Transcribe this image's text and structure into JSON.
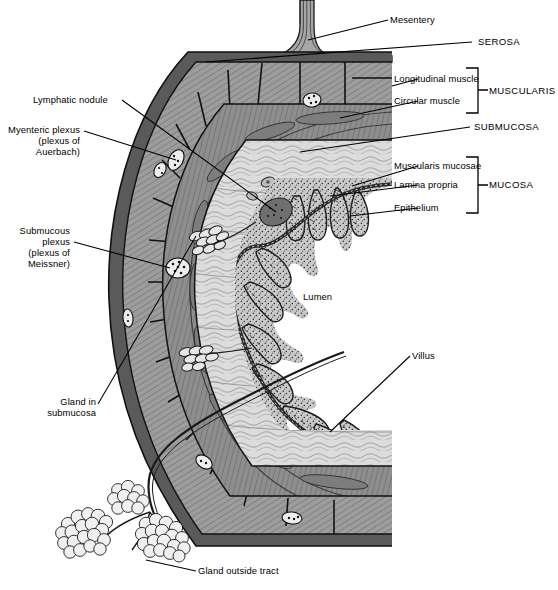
{
  "figure": {
    "background_color": "#ffffff",
    "ink_color": "#000000",
    "palette": {
      "serosa_dark": "#3a3a3a",
      "longitudinal_muscle": "#9a9a9a",
      "circular_muscle": "#8c8c8c",
      "submucosa": "#d9d9d9",
      "lamina_propria": "#c3c3c3",
      "muscularis_mucosae": "#4a4a4a",
      "lumen": "#ffffff",
      "gland_fill": "#e8e8e8"
    }
  },
  "labels": {
    "mesentery": "Mesentery",
    "serosa": "SEROSA",
    "longitudinal_muscle": "Longitudinal muscle",
    "circular_muscle": "Circular muscle",
    "muscularis": "MUSCULARIS",
    "submucosa": "SUBMUCOSA",
    "muscularis_mucosae": "Muscularis mucosae",
    "lamina_propria": "Lamina propria",
    "epithelium": "Epithelium",
    "mucosa": "MUCOSA",
    "lymphatic_nodule": "Lymphatic nodule",
    "myenteric_plexus_l1": "Myenteric plexus",
    "myenteric_plexus_l2": "(plexus of",
    "myenteric_plexus_l3": "Auerbach)",
    "submucous_plexus_l1": "Submucous",
    "submucous_plexus_l2": "plexus",
    "submucous_plexus_l3": "(plexus of",
    "submucous_plexus_l4": "Meissner)",
    "gland_in_submucosa_l1": "Gland in",
    "gland_in_submucosa_l2": "submucosa",
    "lumen": "Lumen",
    "villus": "Villus",
    "gland_outside_tract": "Gland outside tract"
  },
  "layers": [
    {
      "name": "Serosa",
      "group": "",
      "order": 1
    },
    {
      "name": "Longitudinal muscle",
      "group": "MUSCULARIS",
      "order": 2
    },
    {
      "name": "Circular muscle",
      "group": "MUSCULARIS",
      "order": 3
    },
    {
      "name": "Submucosa",
      "group": "SUBMUCOSA",
      "order": 4
    },
    {
      "name": "Muscularis mucosae",
      "group": "MUCOSA",
      "order": 5
    },
    {
      "name": "Lamina propria",
      "group": "MUCOSA",
      "order": 6
    },
    {
      "name": "Epithelium",
      "group": "MUCOSA",
      "order": 7
    }
  ]
}
